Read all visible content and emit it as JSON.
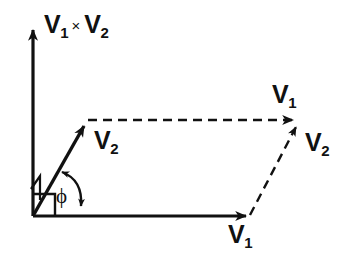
{
  "figure": {
    "background_color": "#ffffff",
    "stroke_color": "#111111",
    "labels": {
      "cross_product": {
        "base": "V",
        "sub": "1",
        "operator": "×",
        "base2": "V",
        "sub2": "2"
      },
      "v2_left": {
        "base": "V",
        "sub": "2"
      },
      "v1_top": {
        "base": "V",
        "sub": "1"
      },
      "v2_right": {
        "base": "V",
        "sub": "2"
      },
      "v1_bottom": {
        "base": "V",
        "sub": "1"
      },
      "angle": "ϕ"
    },
    "geometry": {
      "origin": {
        "x": 33,
        "y": 216
      },
      "vertical_axis_tip": {
        "x": 33,
        "y": 26
      },
      "horizontal_axis_tip": {
        "x": 250,
        "y": 216
      },
      "v2_tip": {
        "x": 88,
        "y": 119
      },
      "far_vertex": {
        "x": 300,
        "y": 120
      },
      "angle_degrees": 60
    }
  }
}
